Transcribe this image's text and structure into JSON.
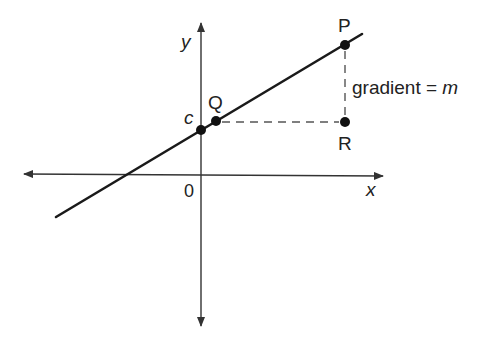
{
  "diagram": {
    "type": "straight-line graph",
    "axes": {
      "x_label": "x",
      "y_label": "y",
      "origin_label": "0"
    },
    "points": {
      "c": {
        "label": "c",
        "meaning": "y-intercept"
      },
      "Q": {
        "label": "Q"
      },
      "P": {
        "label": "P"
      },
      "R": {
        "label": "R"
      }
    },
    "annotation": {
      "text_prefix": "gradient = ",
      "text_var": "m"
    },
    "colors": {
      "line": "#1a1a1a",
      "axes": "#333333",
      "dashed": "#555555"
    }
  }
}
